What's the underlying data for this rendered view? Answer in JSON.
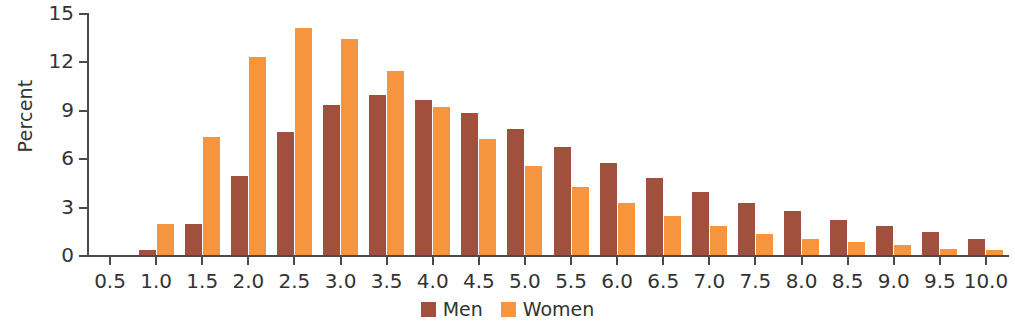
{
  "chart_data": {
    "type": "bar",
    "title": "",
    "subtitle": "",
    "xlabel": "",
    "ylabel": "Percent",
    "ylim": [
      0,
      15
    ],
    "ytick_labels": [
      "0",
      "3",
      "6",
      "9",
      "12",
      "15"
    ],
    "ytick_values": [
      0,
      3,
      6,
      9,
      12,
      15
    ],
    "grid": false,
    "legend_position": "bottom-center",
    "categories": [
      "0.5",
      "1.0",
      "1.5",
      "2.0",
      "2.5",
      "3.0",
      "3.5",
      "4.0",
      "4.5",
      "5.0",
      "5.5",
      "6.0",
      "6.5",
      "7.0",
      "7.5",
      "8.0",
      "8.5",
      "9.0",
      "9.5",
      "10.0"
    ],
    "series": [
      {
        "name": "Men",
        "color": "#a0503c",
        "values": [
          0,
          0.3,
          1.9,
          4.9,
          7.6,
          9.3,
          9.9,
          9.6,
          8.8,
          7.8,
          6.7,
          5.7,
          4.8,
          3.9,
          3.2,
          2.7,
          2.2,
          1.8,
          1.4,
          1.0
        ]
      },
      {
        "name": "Women",
        "color": "#f7943e",
        "values": [
          0,
          1.9,
          7.3,
          12.3,
          14.1,
          13.4,
          11.4,
          9.2,
          7.2,
          5.5,
          4.2,
          3.2,
          2.4,
          1.8,
          1.3,
          1.0,
          0.8,
          0.6,
          0.4,
          0.3
        ]
      }
    ]
  },
  "legend": {
    "items": [
      {
        "label": "Men",
        "color": "#a0503c"
      },
      {
        "label": "Women",
        "color": "#f7943e"
      }
    ]
  },
  "axes": {
    "y_title": "Percent"
  }
}
